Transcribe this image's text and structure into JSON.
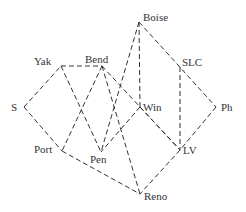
{
  "diagram": {
    "type": "graph",
    "nodes": [
      {
        "id": "S",
        "label": "S",
        "x": 24,
        "y": 107,
        "lx": 11,
        "ly": 111
      },
      {
        "id": "Yak",
        "label": "Yak",
        "x": 61,
        "y": 66,
        "lx": 34,
        "ly": 65
      },
      {
        "id": "Bend",
        "label": "Bend",
        "x": 102,
        "y": 66,
        "lx": 85,
        "ly": 63
      },
      {
        "id": "Boise",
        "label": "Boise",
        "x": 139,
        "y": 22,
        "lx": 143,
        "ly": 21
      },
      {
        "id": "SLC",
        "label": "SLC",
        "x": 180,
        "y": 67,
        "lx": 182,
        "ly": 66
      },
      {
        "id": "Win",
        "label": "Win",
        "x": 140,
        "y": 107,
        "lx": 143,
        "ly": 111
      },
      {
        "id": "Ph",
        "label": "Ph",
        "x": 216,
        "y": 107,
        "lx": 221,
        "ly": 111
      },
      {
        "id": "Port",
        "label": "Port",
        "x": 62,
        "y": 151,
        "lx": 34,
        "ly": 153
      },
      {
        "id": "Pen",
        "label": "Pen",
        "x": 101,
        "y": 152,
        "lx": 90,
        "ly": 163
      },
      {
        "id": "LV",
        "label": "LV",
        "x": 180,
        "y": 150,
        "lx": 183,
        "ly": 154
      },
      {
        "id": "Reno",
        "label": "Reno",
        "x": 140,
        "y": 194,
        "lx": 144,
        "ly": 200
      }
    ],
    "edges": [
      [
        "S",
        "Yak"
      ],
      [
        "S",
        "Port"
      ],
      [
        "Yak",
        "Bend"
      ],
      [
        "Yak",
        "Pen"
      ],
      [
        "Bend",
        "Port"
      ],
      [
        "Bend",
        "Reno"
      ],
      [
        "Bend",
        "LV"
      ],
      [
        "Boise",
        "Pen"
      ],
      [
        "Boise",
        "Win"
      ],
      [
        "Boise",
        "Ph"
      ],
      [
        "SLC",
        "LV"
      ],
      [
        "Win",
        "Pen"
      ],
      [
        "Win",
        "LV"
      ],
      [
        "Ph",
        "LV"
      ],
      [
        "Port",
        "Reno"
      ],
      [
        "LV",
        "Reno"
      ]
    ]
  },
  "colors": {
    "line": "#333333",
    "text": "#333333",
    "background": "#ffffff"
  }
}
